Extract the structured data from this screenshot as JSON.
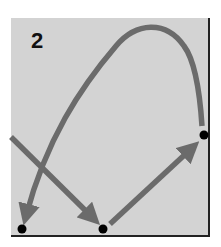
{
  "diagram": {
    "panel_label": "2",
    "colors": {
      "background": "#d3d3d3",
      "arrow": "#6b6b6b",
      "node": "#000000",
      "border": "#222222"
    },
    "nodes": [
      {
        "id": "bottom-left",
        "x": 22,
        "y": 229
      },
      {
        "id": "bottom-middle",
        "x": 103,
        "y": 229
      },
      {
        "id": "right",
        "x": 204,
        "y": 135
      }
    ],
    "arrows": [
      {
        "id": "entering-diagonal",
        "from": "off-panel-left",
        "to": "bottom-middle"
      },
      {
        "id": "diagonal-up",
        "from": "bottom-middle",
        "to": "right"
      },
      {
        "id": "big-arc",
        "from": "right",
        "to": "bottom-left"
      }
    ]
  }
}
